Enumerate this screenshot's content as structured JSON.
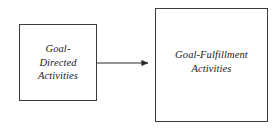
{
  "diagram": {
    "type": "flow-diagram",
    "background_color": "#ffffff",
    "border_color": "#3a3a3a",
    "text_color": "#1a1a1a",
    "arrow_color": "#2b2b2b",
    "nodes": [
      {
        "id": "goal-directed",
        "label": "Goal-\nDirected\nActivities",
        "shape": "rectangle",
        "x": 19,
        "y": 24,
        "width": 78,
        "height": 77
      },
      {
        "id": "goal-fulfillment",
        "label": "Goal-Fulfillment\nActivities",
        "shape": "rectangle",
        "x": 155,
        "y": 8,
        "width": 113,
        "height": 114
      }
    ],
    "edges": [
      {
        "id": "edge-goal-directed-to-goal-fulfillment",
        "from": "goal-directed",
        "to": "goal-fulfillment",
        "label": "",
        "style": "solid",
        "arrowhead": "filled-triangle",
        "x1": 97,
        "y1": 63,
        "x2": 154,
        "y2": 63
      }
    ]
  }
}
